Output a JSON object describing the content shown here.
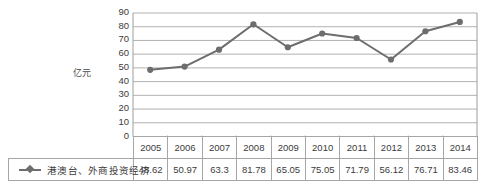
{
  "chart_data": {
    "type": "line",
    "title": "",
    "subtitle": "",
    "xlabel": "",
    "ylabel": "亿元",
    "ylim": [
      0,
      90
    ],
    "ytick_step": 10,
    "yticks": [
      90,
      80,
      70,
      60,
      50,
      40,
      30,
      20,
      10,
      0
    ],
    "grid": "horizontal",
    "legend_position": "table-row-left",
    "categories": [
      "2005",
      "2006",
      "2007",
      "2008",
      "2009",
      "2010",
      "2011",
      "2012",
      "2013",
      "2014"
    ],
    "series": [
      {
        "name": "港澳台、外商投资经济",
        "values": [
          48.62,
          50.97,
          63.3,
          81.78,
          65.05,
          75.05,
          71.79,
          56.12,
          76.71,
          83.46
        ],
        "color": "#6d6d6d",
        "marker": "diamond"
      }
    ],
    "annotations": []
  },
  "table": {
    "corner_label": "",
    "header_row": [
      "2005",
      "2006",
      "2007",
      "2008",
      "2009",
      "2010",
      "2011",
      "2012",
      "2013",
      "2014"
    ],
    "series_label": "港澳台、外商投资经济",
    "value_row": [
      "48.62",
      "50.97",
      "63.3",
      "81.78",
      "65.05",
      "75.05",
      "71.79",
      "56.12",
      "76.71",
      "83.46"
    ]
  },
  "colors": {
    "series": "#6d6d6d",
    "grid": "#9d9d9d",
    "axis": "#9d9d9d",
    "border": "#a6a6a6",
    "text": "#3b3b3b",
    "background": "#ffffff"
  }
}
